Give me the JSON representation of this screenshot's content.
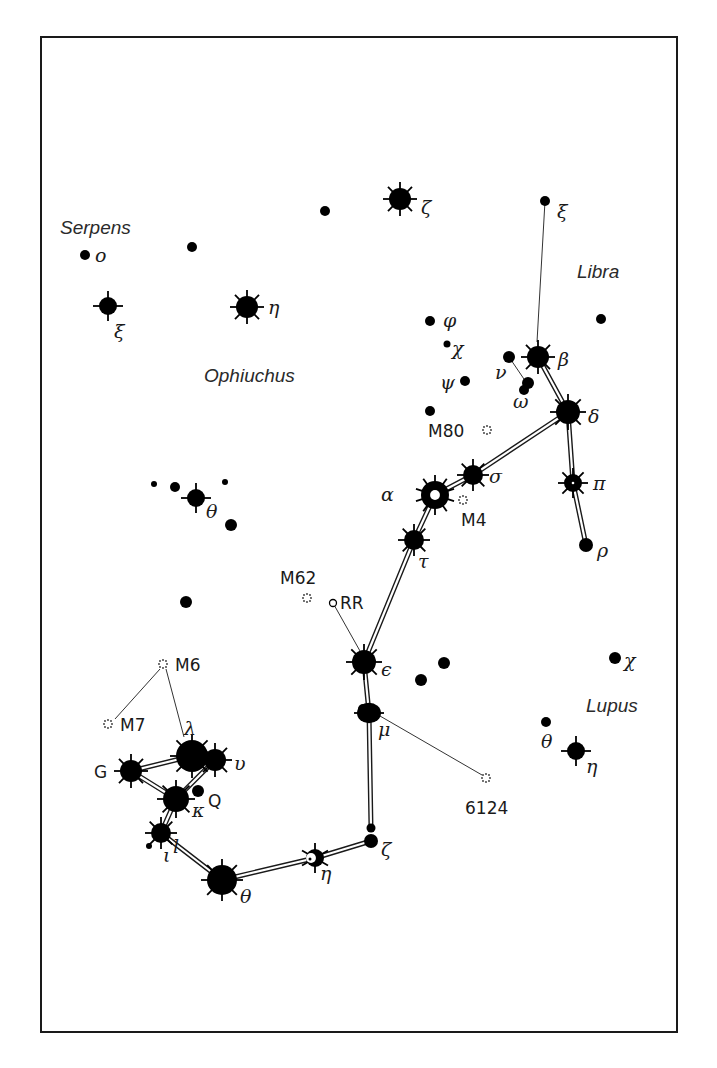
{
  "frame": {
    "x": 41,
    "y": 37,
    "w": 636,
    "h": 995
  },
  "constellation_labels": [
    {
      "text": "Serpens",
      "x": 60,
      "y": 234
    },
    {
      "text": "Ophiuchus",
      "x": 204,
      "y": 382
    },
    {
      "text": "Libra",
      "x": 577,
      "y": 278
    },
    {
      "text": "Lupus",
      "x": 586,
      "y": 712
    }
  ],
  "stars": [
    {
      "id": "ser-o",
      "x": 85,
      "y": 255,
      "r": 5,
      "type": "dot",
      "label": "ο",
      "lx": 95,
      "ly": 262
    },
    {
      "id": "ser-xi",
      "x": 108,
      "y": 306,
      "r": 9,
      "type": "rayed4",
      "label": "ξ",
      "lx": 114,
      "ly": 338
    },
    {
      "id": "oph-a",
      "x": 192,
      "y": 247,
      "r": 5,
      "type": "dot"
    },
    {
      "id": "oph-b",
      "x": 325,
      "y": 211,
      "r": 5,
      "type": "dot"
    },
    {
      "id": "oph-zeta",
      "x": 400,
      "y": 199,
      "r": 11,
      "type": "rayed8",
      "label": "ζ",
      "lx": 421,
      "ly": 214
    },
    {
      "id": "oph-eta",
      "x": 247,
      "y": 307,
      "r": 11,
      "type": "rayed8",
      "label": "η",
      "lx": 268,
      "ly": 314
    },
    {
      "id": "lib-xi",
      "x": 545,
      "y": 201,
      "r": 5,
      "type": "dot",
      "label": "ξ",
      "lx": 557,
      "ly": 218
    },
    {
      "id": "lib-dot",
      "x": 601,
      "y": 319,
      "r": 5,
      "type": "dot"
    },
    {
      "id": "sco-phi",
      "x": 430,
      "y": 321,
      "r": 5,
      "type": "dot",
      "label": "φ",
      "lx": 443,
      "ly": 327
    },
    {
      "id": "sco-chi",
      "x": 447,
      "y": 344,
      "r": 3.5,
      "type": "dot",
      "label": "χ",
      "lx": 452,
      "ly": 355
    },
    {
      "id": "sco-psi",
      "x": 465,
      "y": 381,
      "r": 5,
      "type": "dot",
      "label": "ψ",
      "lx": 440,
      "ly": 389
    },
    {
      "id": "sco-m80star",
      "x": 430,
      "y": 411,
      "r": 5,
      "type": "dot"
    },
    {
      "id": "sco-nu",
      "x": 509,
      "y": 357,
      "r": 6,
      "type": "dot",
      "label": "ν",
      "lx": 495,
      "ly": 379
    },
    {
      "id": "sco-omega1",
      "x": 528,
      "y": 383,
      "r": 6,
      "type": "dot"
    },
    {
      "id": "sco-omega2",
      "x": 524,
      "y": 390,
      "r": 5,
      "type": "dot",
      "label": "ω",
      "lx": 513,
      "ly": 408
    },
    {
      "id": "sco-beta",
      "x": 538,
      "y": 357,
      "r": 11,
      "type": "rayed8",
      "label": "β",
      "lx": 558,
      "ly": 366
    },
    {
      "id": "sco-delta",
      "x": 568,
      "y": 412,
      "r": 12,
      "type": "rayed8",
      "label": "δ",
      "lx": 588,
      "ly": 423
    },
    {
      "id": "sco-pi",
      "x": 573,
      "y": 483,
      "r": 9,
      "type": "rayed8",
      "label": "π",
      "lx": 593,
      "ly": 490
    },
    {
      "id": "sco-rho",
      "x": 586,
      "y": 545,
      "r": 7,
      "type": "dot",
      "label": "ρ",
      "lx": 597,
      "ly": 557
    },
    {
      "id": "sco-sigma",
      "x": 473,
      "y": 475,
      "r": 10,
      "type": "rayed8",
      "label": "σ",
      "lx": 489,
      "ly": 483
    },
    {
      "id": "sco-alpha",
      "x": 435,
      "y": 495,
      "r": 14,
      "type": "rayed10-ring",
      "label": "α",
      "lx": 381,
      "ly": 501
    },
    {
      "id": "sco-tau",
      "x": 414,
      "y": 540,
      "r": 10,
      "type": "rayed8",
      "label": "τ",
      "lx": 418,
      "ly": 568
    },
    {
      "id": "sco-rr",
      "x": 333,
      "y": 603,
      "r": 3.5,
      "type": "open",
      "label": "RR",
      "lx": 340,
      "ly": 609
    },
    {
      "id": "sco-epsilon",
      "x": 364,
      "y": 662,
      "r": 12,
      "type": "rayed8",
      "label": "ϵ",
      "lx": 381,
      "ly": 676
    },
    {
      "id": "sco-e1",
      "x": 421,
      "y": 680,
      "r": 6,
      "type": "dot"
    },
    {
      "id": "sco-e2",
      "x": 444,
      "y": 663,
      "r": 6,
      "type": "dot"
    },
    {
      "id": "sco-mu",
      "x": 369,
      "y": 713,
      "r": 12,
      "type": "blob",
      "label": "μ",
      "lx": 378,
      "ly": 736
    },
    {
      "id": "sco-zeta-a",
      "x": 371,
      "y": 828,
      "r": 4.5,
      "type": "dot"
    },
    {
      "id": "sco-zeta-b",
      "x": 371,
      "y": 841,
      "r": 7,
      "type": "dot",
      "label": "ζ",
      "lx": 381,
      "ly": 856
    },
    {
      "id": "sco-eta",
      "x": 315,
      "y": 858,
      "r": 9,
      "type": "rayed6-crescent",
      "label": "η",
      "lx": 320,
      "ly": 880
    },
    {
      "id": "sco-theta",
      "x": 222,
      "y": 880,
      "r": 15,
      "type": "rayed8",
      "label": "θ",
      "lx": 240,
      "ly": 903
    },
    {
      "id": "sco-iota",
      "x": 161,
      "y": 833,
      "r": 10,
      "type": "rayed8",
      "label": "ι",
      "lx": 163,
      "ly": 862
    },
    {
      "id": "sco-iota2",
      "x": 149,
      "y": 846,
      "r": 3,
      "type": "dot"
    },
    {
      "id": "sco-l",
      "x": 0,
      "y": 0,
      "r": 0,
      "type": "none",
      "label": "l",
      "lx": 173,
      "ly": 853
    },
    {
      "id": "sco-kappa",
      "x": 176,
      "y": 799,
      "r": 13,
      "type": "rayed8",
      "label": "κ",
      "lx": 192,
      "ly": 817
    },
    {
      "id": "sco-q",
      "x": 198,
      "y": 791,
      "r": 6,
      "type": "dot",
      "label": "Q",
      "lx": 208,
      "ly": 807
    },
    {
      "id": "sco-lambda",
      "x": 192,
      "y": 756,
      "r": 16,
      "type": "rayed8",
      "label": "λ",
      "lx": 184,
      "ly": 735
    },
    {
      "id": "sco-upsilon",
      "x": 215,
      "y": 760,
      "r": 11,
      "type": "rayed8",
      "label": "υ",
      "lx": 234,
      "ly": 770
    },
    {
      "id": "sco-g",
      "x": 131,
      "y": 771,
      "r": 11,
      "type": "rayed8",
      "label": "G",
      "lx": 94,
      "ly": 778
    },
    {
      "id": "sco-tl1",
      "x": 154,
      "y": 484,
      "r": 3,
      "type": "dot"
    },
    {
      "id": "sco-tl2",
      "x": 175,
      "y": 487,
      "r": 5,
      "type": "dot"
    },
    {
      "id": "sco-tl3",
      "x": 225,
      "y": 482,
      "r": 3,
      "type": "dot"
    },
    {
      "id": "oph-theta",
      "x": 196,
      "y": 498,
      "r": 9,
      "type": "rayed4",
      "label": "θ",
      "lx": 206,
      "ly": 518
    },
    {
      "id": "oph-t4",
      "x": 231,
      "y": 525,
      "r": 6,
      "type": "dot"
    },
    {
      "id": "oph-t5",
      "x": 186,
      "y": 602,
      "r": 6,
      "type": "dot"
    },
    {
      "id": "lup-chi",
      "x": 615,
      "y": 658,
      "r": 6,
      "type": "dot",
      "label": "χ",
      "lx": 624,
      "ly": 667
    },
    {
      "id": "lup-theta",
      "x": 546,
      "y": 722,
      "r": 5,
      "type": "dot",
      "label": "θ",
      "lx": 541,
      "ly": 748
    },
    {
      "id": "lup-eta",
      "x": 576,
      "y": 751,
      "r": 9,
      "type": "rayed4",
      "label": "η",
      "lx": 586,
      "ly": 773
    }
  ],
  "deep_sky": [
    {
      "id": "M80",
      "x": 487,
      "y": 430,
      "label": "M80",
      "lx": 428,
      "ly": 437
    },
    {
      "id": "M4",
      "x": 463,
      "y": 500,
      "label": "M4",
      "lx": 461,
      "ly": 526
    },
    {
      "id": "M62",
      "x": 307,
      "y": 598,
      "label": "M62",
      "lx": 280,
      "ly": 584
    },
    {
      "id": "M6",
      "x": 163,
      "y": 664,
      "label": "M6",
      "lx": 175,
      "ly": 671
    },
    {
      "id": "M7",
      "x": 108,
      "y": 724,
      "label": "M7",
      "lx": 120,
      "ly": 731
    },
    {
      "id": "NGC6124",
      "x": 486,
      "y": 778,
      "label": "6124",
      "lx": 465,
      "ly": 814
    }
  ],
  "figure_lines": [
    [
      538,
      357,
      568,
      412
    ],
    [
      568,
      412,
      573,
      483
    ],
    [
      573,
      483,
      586,
      545
    ],
    [
      568,
      412,
      473,
      475
    ],
    [
      473,
      475,
      435,
      495
    ],
    [
      435,
      495,
      414,
      540
    ],
    [
      414,
      540,
      364,
      662
    ],
    [
      364,
      662,
      369,
      713
    ],
    [
      369,
      713,
      371,
      828
    ],
    [
      371,
      841,
      315,
      858
    ],
    [
      315,
      858,
      222,
      880
    ],
    [
      222,
      880,
      161,
      833
    ],
    [
      161,
      833,
      176,
      799
    ],
    [
      176,
      799,
      131,
      771
    ],
    [
      131,
      771,
      192,
      756
    ],
    [
      176,
      799,
      215,
      760
    ]
  ],
  "pointer_lines": [
    [
      545,
      201,
      537,
      342
    ],
    [
      509,
      357,
      526,
      382
    ],
    [
      333,
      603,
      360,
      651
    ],
    [
      380,
      716,
      482,
      775
    ],
    [
      160,
      669,
      115,
      719
    ],
    [
      166,
      669,
      184,
      737
    ]
  ]
}
